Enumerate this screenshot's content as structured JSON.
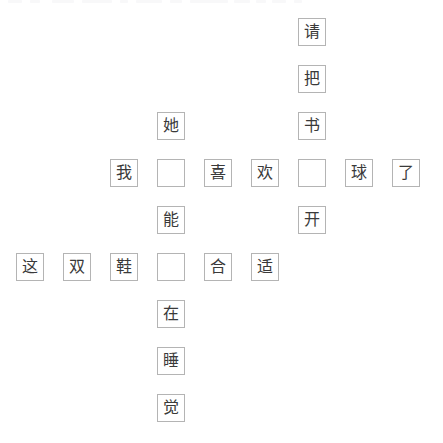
{
  "board": {
    "title": "Chinese character crossword grid",
    "columns": 9,
    "rows": 9,
    "cell_size": 28,
    "cell_pitch": 47,
    "origin_x": 16,
    "origin_y": 18,
    "border_color": "#b4b4b4",
    "text_color": "#3a3a3a",
    "background_color": "#ffffff"
  },
  "cells": [
    {
      "row": 1,
      "col": 7,
      "text": "请",
      "filled": true
    },
    {
      "row": 2,
      "col": 7,
      "text": "把",
      "filled": true
    },
    {
      "row": 3,
      "col": 4,
      "text": "她",
      "filled": true
    },
    {
      "row": 3,
      "col": 7,
      "text": "书",
      "filled": true
    },
    {
      "row": 4,
      "col": 3,
      "text": "我",
      "filled": true
    },
    {
      "row": 4,
      "col": 4,
      "text": "",
      "filled": false
    },
    {
      "row": 4,
      "col": 5,
      "text": "喜",
      "filled": true
    },
    {
      "row": 4,
      "col": 6,
      "text": "欢",
      "filled": true
    },
    {
      "row": 4,
      "col": 7,
      "text": "",
      "filled": false
    },
    {
      "row": 4,
      "col": 8,
      "text": "球",
      "filled": true
    },
    {
      "row": 4,
      "col": 9,
      "text": "了",
      "filled": true
    },
    {
      "row": 5,
      "col": 4,
      "text": "能",
      "filled": true
    },
    {
      "row": 5,
      "col": 7,
      "text": "开",
      "filled": true
    },
    {
      "row": 6,
      "col": 1,
      "text": "这",
      "filled": true
    },
    {
      "row": 6,
      "col": 2,
      "text": "双",
      "filled": true
    },
    {
      "row": 6,
      "col": 3,
      "text": "鞋",
      "filled": true
    },
    {
      "row": 6,
      "col": 4,
      "text": "",
      "filled": false
    },
    {
      "row": 6,
      "col": 5,
      "text": "合",
      "filled": true
    },
    {
      "row": 6,
      "col": 6,
      "text": "适",
      "filled": true
    },
    {
      "row": 7,
      "col": 4,
      "text": "在",
      "filled": true
    },
    {
      "row": 8,
      "col": 4,
      "text": "睡",
      "filled": true
    },
    {
      "row": 9,
      "col": 4,
      "text": "觉",
      "filled": true
    }
  ],
  "top_strip": {
    "ghosts": [
      {
        "x": 8,
        "w": 14
      },
      {
        "x": 30,
        "w": 10
      },
      {
        "x": 52,
        "w": 22
      },
      {
        "x": 82,
        "w": 30
      },
      {
        "x": 120,
        "w": 8
      },
      {
        "x": 136,
        "w": 26
      },
      {
        "x": 170,
        "w": 12
      },
      {
        "x": 190,
        "w": 38
      },
      {
        "x": 234,
        "w": 16
      },
      {
        "x": 256,
        "w": 10
      },
      {
        "x": 272,
        "w": 14
      },
      {
        "x": 294,
        "w": 8
      }
    ]
  }
}
